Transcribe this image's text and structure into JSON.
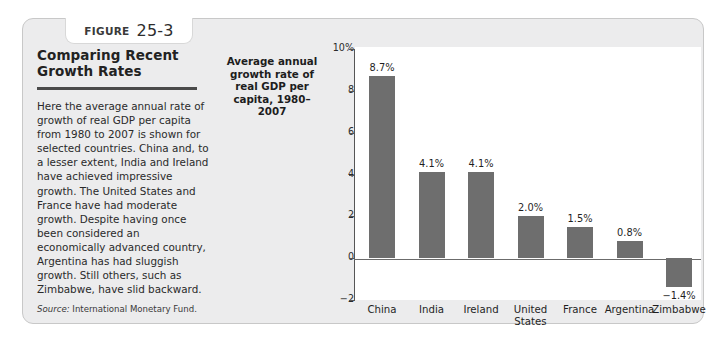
{
  "figure": {
    "label_word": "FIGURE",
    "number": "25-3"
  },
  "caption": {
    "title": "Comparing Recent Growth Rates",
    "body": "Here the average annual rate of growth of real GDP per capita from 1980 to 2007 is shown for selected countries. China and, to a lesser extent, India and Ireland have achieved impressive growth. The United States and France have had moderate growth. Despite having once been considered an economically advanced country, Argentina has had sluggish growth. Still others, such as Zimbabwe, have slid backward.",
    "source_label": "Source:",
    "source_text": "International Monetary Fund."
  },
  "chart_data": {
    "type": "bar",
    "title": "",
    "ylabel": "Average annual growth rate of real GDP per capita, 1980–2007",
    "xlabel": "",
    "categories": [
      "China",
      "India",
      "Ireland",
      "United States",
      "France",
      "Argentina",
      "Zimbabwe"
    ],
    "values": [
      8.7,
      4.1,
      4.1,
      2.0,
      1.5,
      0.8,
      -1.4
    ],
    "value_labels": [
      "8.7%",
      "4.1%",
      "4.1%",
      "2.0%",
      "1.5%",
      "0.8%",
      "−1.4%"
    ],
    "ylim": [
      -2,
      10
    ],
    "yticks": [
      10,
      8,
      6,
      4,
      2,
      0,
      -2
    ],
    "ytick_labels": [
      "10%",
      "8",
      "6",
      "4",
      "2",
      "0",
      "−2"
    ],
    "grid": false,
    "legend": false,
    "bar_color": "#6e6e6e"
  }
}
